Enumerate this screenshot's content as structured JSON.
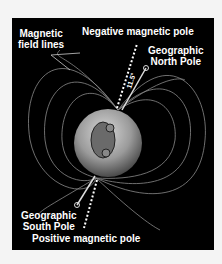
{
  "labels": {
    "field_lines": [
      "Magnetic",
      "field lines"
    ],
    "negative_pole": "Negative magnetic pole",
    "geo_north": [
      "Geographic",
      "North Pole"
    ],
    "geo_south": [
      "Geographic",
      "South Pole"
    ],
    "positive_pole": "Positive magnetic pole",
    "angle": "11.5°"
  },
  "colors": {
    "background": "#000000",
    "page": "#f4f4f4",
    "text": "#ffffff",
    "field_line": "#9a9a9a"
  }
}
